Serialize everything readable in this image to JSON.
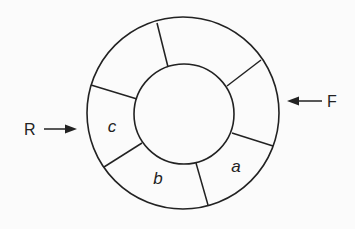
{
  "diagram": {
    "type": "circular-queue",
    "rear_label": "R",
    "front_label": "F",
    "slot_labels": {
      "a": "a",
      "b": "b",
      "c": "c"
    },
    "num_slots": 6,
    "colors": {
      "stroke": "#222222",
      "background": "#fbfbfb"
    }
  }
}
